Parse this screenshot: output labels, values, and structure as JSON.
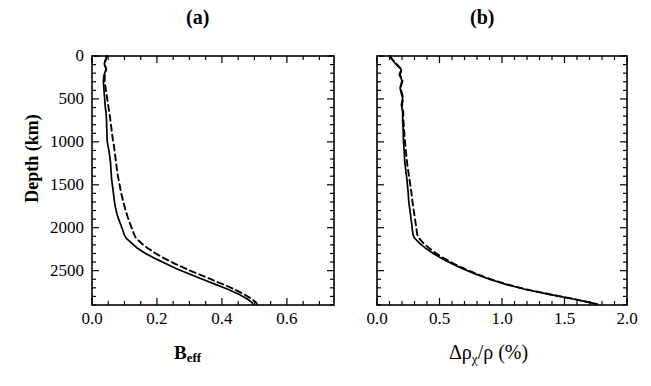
{
  "figure": {
    "background": "#ffffff",
    "line_color": "#000000",
    "panels": [
      {
        "id": "a",
        "label": "(a)",
        "frame": {
          "x": 92,
          "y": 56,
          "width": 242,
          "height": 249
        }
      },
      {
        "id": "b",
        "label": "(b)",
        "frame": {
          "x": 377,
          "y": 56,
          "width": 250,
          "height": 249
        }
      }
    ],
    "y_axis": {
      "title": "Depth (km)",
      "tick_labels": [
        "0",
        "500",
        "1000",
        "1500",
        "2000",
        "2500"
      ],
      "tick_values": [
        0,
        500,
        1000,
        1500,
        2000,
        2500
      ],
      "minor_step": 100,
      "range": [
        0,
        2900
      ],
      "direction": "inverted"
    }
  },
  "chart_data": [
    {
      "type": "line",
      "panel": "a",
      "title": "(a)",
      "xlabel": "B_eff",
      "ylabel": "Depth (km)",
      "xlim": [
        0.0,
        0.745
      ],
      "ylim": [
        0,
        2900
      ],
      "y_inverted": true,
      "xticks": [
        0.0,
        0.2,
        0.4,
        0.6
      ],
      "xtick_labels": [
        "0.0",
        "0.2",
        "0.4",
        "0.6"
      ],
      "x_minor_step": 0.05,
      "yticks": [
        0,
        500,
        1000,
        1500,
        2000,
        2500
      ],
      "ytick_labels": [
        "0",
        "500",
        "1000",
        "1500",
        "2000",
        "2500"
      ],
      "grid": false,
      "legend": "none",
      "series": [
        {
          "name": "solid",
          "style": "solid",
          "depth": [
            0,
            30,
            60,
            90,
            120,
            150,
            180,
            210,
            250,
            300,
            350,
            400,
            450,
            500,
            550,
            600,
            650,
            700,
            760,
            820,
            880,
            940,
            1000,
            1060,
            1120,
            1180,
            1240,
            1300,
            1360,
            1420,
            1480,
            1540,
            1600,
            1660,
            1720,
            1780,
            1840,
            1900,
            1960,
            2020,
            2080,
            2120,
            2180,
            2240,
            2300,
            2360,
            2420,
            2480,
            2540,
            2600,
            2660,
            2720,
            2780,
            2830,
            2870,
            2890
          ],
          "values": [
            0.045,
            0.043,
            0.04,
            0.038,
            0.04,
            0.043,
            0.041,
            0.038,
            0.036,
            0.035,
            0.036,
            0.037,
            0.038,
            0.039,
            0.04,
            0.041,
            0.043,
            0.044,
            0.045,
            0.045,
            0.046,
            0.046,
            0.047,
            0.05,
            0.053,
            0.055,
            0.057,
            0.058,
            0.059,
            0.06,
            0.062,
            0.064,
            0.066,
            0.068,
            0.07,
            0.073,
            0.077,
            0.082,
            0.088,
            0.094,
            0.099,
            0.105,
            0.122,
            0.14,
            0.165,
            0.195,
            0.228,
            0.262,
            0.3,
            0.34,
            0.38,
            0.42,
            0.455,
            0.478,
            0.492,
            0.495
          ]
        },
        {
          "name": "dashed",
          "style": "dashed",
          "depth": [
            0,
            30,
            60,
            90,
            120,
            150,
            180,
            210,
            250,
            300,
            350,
            400,
            450,
            500,
            550,
            600,
            650,
            700,
            760,
            820,
            880,
            940,
            1000,
            1060,
            1120,
            1180,
            1240,
            1300,
            1360,
            1420,
            1480,
            1540,
            1600,
            1660,
            1720,
            1780,
            1840,
            1900,
            1960,
            2020,
            2080,
            2120,
            2180,
            2240,
            2300,
            2360,
            2420,
            2480,
            2540,
            2600,
            2660,
            2720,
            2780,
            2830,
            2870,
            2890
          ],
          "values": [
            0.046,
            0.044,
            0.041,
            0.039,
            0.041,
            0.044,
            0.042,
            0.04,
            0.039,
            0.039,
            0.041,
            0.043,
            0.045,
            0.047,
            0.049,
            0.051,
            0.053,
            0.055,
            0.057,
            0.059,
            0.061,
            0.063,
            0.065,
            0.068,
            0.07,
            0.072,
            0.074,
            0.076,
            0.078,
            0.081,
            0.084,
            0.087,
            0.09,
            0.094,
            0.098,
            0.102,
            0.107,
            0.112,
            0.118,
            0.124,
            0.13,
            0.135,
            0.152,
            0.172,
            0.196,
            0.224,
            0.256,
            0.29,
            0.327,
            0.366,
            0.404,
            0.44,
            0.47,
            0.492,
            0.505,
            0.508
          ]
        }
      ]
    },
    {
      "type": "line",
      "panel": "b",
      "title": "(b)",
      "xlabel": "Δρ_χ/ρ (%)",
      "ylabel": "Depth (km)",
      "xlim": [
        0.0,
        2.0
      ],
      "ylim": [
        0,
        2900
      ],
      "y_inverted": true,
      "xticks": [
        0.0,
        0.5,
        1.0,
        1.5,
        2.0
      ],
      "xtick_labels": [
        "0.0",
        "0.5",
        "1.0",
        "1.5",
        "2.0"
      ],
      "x_minor_step": 0.1,
      "yticks": [
        0,
        500,
        1000,
        1500,
        2000,
        2500
      ],
      "ytick_labels": [
        "0",
        "500",
        "1000",
        "1500",
        "2000",
        "2500"
      ],
      "grid": false,
      "legend": "none",
      "series": [
        {
          "name": "solid",
          "style": "solid",
          "depth": [
            0,
            25,
            50,
            75,
            100,
            130,
            160,
            190,
            220,
            250,
            290,
            330,
            370,
            410,
            450,
            490,
            530,
            570,
            610,
            650,
            700,
            760,
            820,
            880,
            940,
            1000,
            1060,
            1120,
            1180,
            1240,
            1300,
            1360,
            1420,
            1480,
            1540,
            1600,
            1660,
            1720,
            1780,
            1840,
            1900,
            1960,
            2020,
            2080,
            2120,
            2180,
            2240,
            2300,
            2360,
            2420,
            2480,
            2540,
            2600,
            2660,
            2720,
            2780,
            2830,
            2870,
            2890
          ],
          "values": [
            0.1,
            0.11,
            0.125,
            0.14,
            0.155,
            0.175,
            0.195,
            0.185,
            0.178,
            0.19,
            0.2,
            0.192,
            0.185,
            0.19,
            0.198,
            0.205,
            0.2,
            0.195,
            0.2,
            0.205,
            0.205,
            0.205,
            0.208,
            0.21,
            0.21,
            0.212,
            0.215,
            0.218,
            0.22,
            0.222,
            0.228,
            0.232,
            0.238,
            0.242,
            0.246,
            0.25,
            0.252,
            0.256,
            0.262,
            0.268,
            0.272,
            0.278,
            0.282,
            0.288,
            0.3,
            0.34,
            0.39,
            0.45,
            0.52,
            0.6,
            0.69,
            0.79,
            0.9,
            1.03,
            1.19,
            1.39,
            1.57,
            1.7,
            1.76
          ]
        },
        {
          "name": "dashed",
          "style": "dashed",
          "depth": [
            0,
            25,
            50,
            75,
            100,
            130,
            160,
            190,
            220,
            250,
            290,
            330,
            370,
            410,
            450,
            490,
            530,
            570,
            610,
            650,
            700,
            760,
            820,
            880,
            940,
            1000,
            1060,
            1120,
            1180,
            1240,
            1300,
            1360,
            1420,
            1480,
            1540,
            1600,
            1660,
            1720,
            1780,
            1840,
            1900,
            1960,
            2020,
            2080,
            2120,
            2180,
            2240,
            2300,
            2360,
            2420,
            2480,
            2540,
            2600,
            2660,
            2720,
            2780,
            2830,
            2870,
            2890
          ],
          "values": [
            0.105,
            0.115,
            0.13,
            0.145,
            0.16,
            0.18,
            0.198,
            0.19,
            0.183,
            0.194,
            0.204,
            0.196,
            0.19,
            0.195,
            0.202,
            0.209,
            0.205,
            0.2,
            0.205,
            0.21,
            0.21,
            0.212,
            0.215,
            0.218,
            0.22,
            0.224,
            0.228,
            0.232,
            0.236,
            0.24,
            0.246,
            0.252,
            0.258,
            0.264,
            0.27,
            0.276,
            0.28,
            0.286,
            0.292,
            0.298,
            0.304,
            0.31,
            0.316,
            0.322,
            0.335,
            0.372,
            0.418,
            0.474,
            0.54,
            0.616,
            0.702,
            0.8,
            0.91,
            1.04,
            1.2,
            1.398,
            1.575,
            1.7,
            1.76
          ]
        }
      ]
    }
  ],
  "labels": {
    "panel_a": "(a)",
    "panel_b": "(b)",
    "y_title": "Depth (km)",
    "x_title_a_main": "B",
    "x_title_a_sub": "eff",
    "x_title_b": "Δρ",
    "x_title_b_sub": "χ",
    "x_title_b_tail": "/ρ (%)",
    "ytick_0": "0",
    "ytick_500": "500",
    "ytick_1000": "1000",
    "ytick_1500": "1500",
    "ytick_2000": "2000",
    "ytick_2500": "2500",
    "a_xtick_0": "0.0",
    "a_xtick_1": "0.2",
    "a_xtick_2": "0.4",
    "a_xtick_3": "0.6",
    "b_xtick_0": "0.0",
    "b_xtick_1": "0.5",
    "b_xtick_2": "1.0",
    "b_xtick_3": "1.5",
    "b_xtick_4": "2.0"
  }
}
